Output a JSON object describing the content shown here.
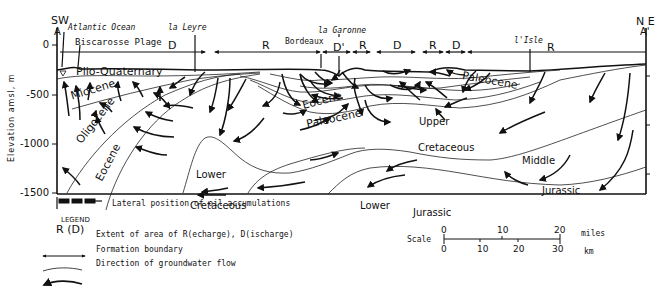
{
  "endpoints": {
    "left": {
      "direction": "SW",
      "label": "A"
    },
    "right": {
      "direction": "N E",
      "label": "A'"
    }
  },
  "places": [
    {
      "name": "Atlantic Ocean",
      "style": "italic"
    },
    {
      "name": "Biscarosse Plage",
      "style": "normal"
    },
    {
      "name": "la Leyre",
      "style": "italic"
    },
    {
      "name": "Bordeaux",
      "style": "normal"
    },
    {
      "name": "la Garonne",
      "style": "italic"
    },
    {
      "name": "l'Isle",
      "style": "italic"
    }
  ],
  "zones": [
    {
      "code": "D",
      "meaning": "Discharge"
    },
    {
      "code": "R",
      "meaning": "Recharge"
    },
    {
      "code": "D'",
      "meaning": "Discharge"
    },
    {
      "code": "R",
      "meaning": "Recharge"
    },
    {
      "code": "D",
      "meaning": "Discharge"
    },
    {
      "code": "R",
      "meaning": "Recharge"
    },
    {
      "code": "D",
      "meaning": "Discharge"
    },
    {
      "code": "R",
      "meaning": "Recharge"
    }
  ],
  "axis": {
    "title": "Elevation amsl, m",
    "ticks": [
      "0",
      "-500",
      "-1000",
      "-1500"
    ]
  },
  "formations": [
    "Plio-Quaternary",
    "Miocene",
    "Oligocene",
    "Eocene",
    "Eocene",
    "Paleocene",
    "Paleocene",
    "Upper",
    "Cretaceous",
    "Lower",
    "Cretaceous",
    "Middle",
    "Jurassic",
    "Lower",
    "Jurassic"
  ],
  "oil": {
    "label": "Lateral position of oil accumulations"
  },
  "legend": {
    "title": "LEGEND",
    "symbol_label": "R (D)",
    "items": [
      {
        "symbol": "double-arrow",
        "text": "Extent of area of R(echarge), D(ischarge)"
      },
      {
        "symbol": "thin-curve",
        "text": "Formation boundary"
      },
      {
        "symbol": "bold-arrow",
        "text": "Direction of groundwater flow"
      }
    ]
  },
  "scale": {
    "label": "Scale",
    "miles_ticks": [
      "0",
      "10",
      "20"
    ],
    "miles_unit": "miles",
    "km_ticks": [
      "0",
      "10",
      "20",
      "30"
    ],
    "km_unit": "km"
  },
  "colors": {
    "ink": "#111111",
    "background": "#ffffff"
  }
}
